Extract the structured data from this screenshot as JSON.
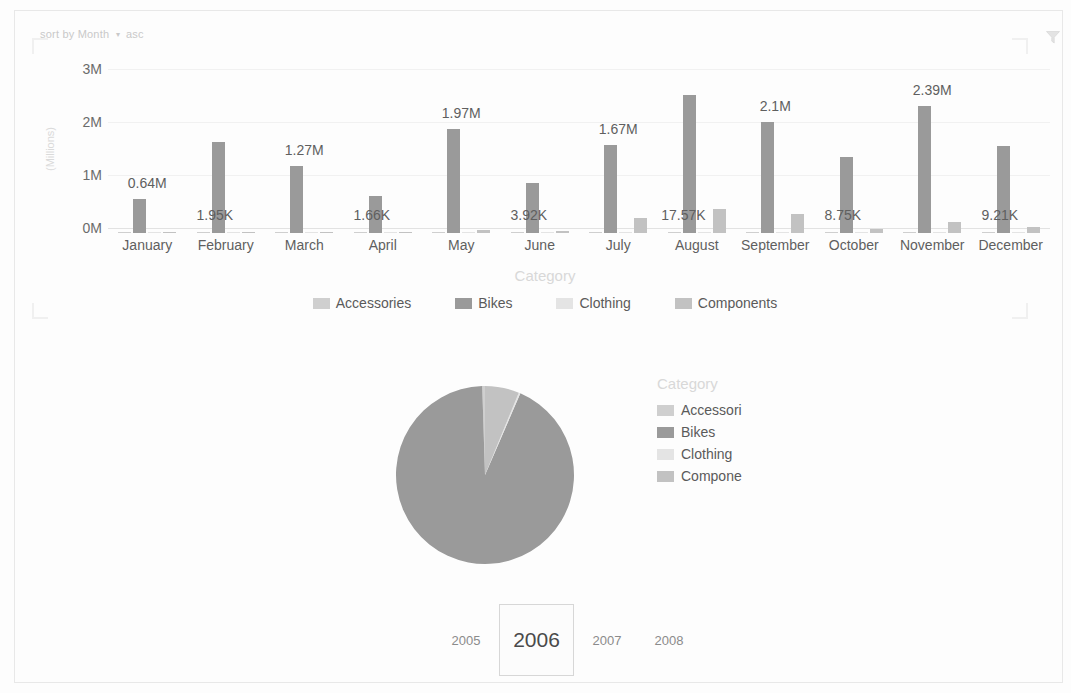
{
  "sort_control": {
    "prefix": "sort by",
    "field": "Month",
    "caret": "▾",
    "direction": "asc"
  },
  "filter": {
    "icon": "filter-funnel-icon"
  },
  "bar_legend": {
    "title": "Category",
    "items": [
      {
        "label": "Accessories",
        "color": "#cfcfcf"
      },
      {
        "label": "Bikes",
        "color": "#9a9a9a"
      },
      {
        "label": "Clothing",
        "color": "#e4e4e4"
      },
      {
        "label": "Components",
        "color": "#c2c2c2"
      }
    ]
  },
  "pie_legend": {
    "title": "Category",
    "items": [
      {
        "label": "Accessori",
        "color": "#cfcfcf"
      },
      {
        "label": "Bikes",
        "color": "#9a9a9a"
      },
      {
        "label": "Clothing",
        "color": "#e4e4e4"
      },
      {
        "label": "Compone",
        "color": "#c2c2c2"
      }
    ]
  },
  "year_slicer": {
    "years": [
      {
        "label": "2005",
        "selected": false
      },
      {
        "label": "2006",
        "selected": true
      },
      {
        "label": "2007",
        "selected": false
      },
      {
        "label": "2008",
        "selected": false
      }
    ]
  },
  "chart_data": [
    {
      "type": "bar",
      "title": "",
      "xlabel": "",
      "ylabel": "(Millions)",
      "ylim": [
        0,
        3000000
      ],
      "yticks": [
        "0M",
        "1M",
        "2M",
        "3M"
      ],
      "ytick_values": [
        0,
        1000000,
        2000000,
        3000000
      ],
      "grid": true,
      "legend_position": "bottom",
      "legend_title": "Category",
      "categories": [
        "January",
        "February",
        "March",
        "April",
        "May",
        "June",
        "July",
        "August",
        "September",
        "October",
        "November",
        "December"
      ],
      "series": [
        {
          "name": "Accessories",
          "color": "#cfcfcf",
          "values": [
            1200,
            1950,
            1400,
            1660,
            2800,
            3920,
            9500,
            17570,
            12000,
            8750,
            14500,
            9210
          ]
        },
        {
          "name": "Bikes",
          "color": "#9a9a9a",
          "values": [
            640000,
            1720000,
            1270000,
            700000,
            1970000,
            940000,
            1670000,
            2600000,
            2100000,
            1440000,
            2390000,
            1650000
          ]
        },
        {
          "name": "Clothing",
          "color": "#e4e4e4",
          "values": [
            900,
            5000,
            1100,
            1300,
            2100,
            3000,
            7000,
            11000,
            9000,
            6500,
            10500,
            7000
          ]
        },
        {
          "name": "Components",
          "color": "#c2c2c2",
          "values": [
            0,
            20000,
            0,
            0,
            52000,
            40000,
            290000,
            460000,
            360000,
            70000,
            210000,
            120000
          ]
        }
      ],
      "data_labels": [
        {
          "category": "January",
          "text": "0.64M"
        },
        {
          "category": "February",
          "text": "1.95K"
        },
        {
          "category": "March",
          "text": "1.27M"
        },
        {
          "category": "April",
          "text": "1.66K"
        },
        {
          "category": "May",
          "text": "1.97M"
        },
        {
          "category": "June",
          "text": "3.92K"
        },
        {
          "category": "July",
          "text": "1.67M"
        },
        {
          "category": "August",
          "text": "17.57K"
        },
        {
          "category": "September",
          "text": "2.1M"
        },
        {
          "category": "October",
          "text": "8.75K"
        },
        {
          "category": "November",
          "text": "2.39M"
        },
        {
          "category": "December",
          "text": "9.21K"
        }
      ]
    },
    {
      "type": "pie",
      "title": "",
      "legend_title": "Category",
      "legend_position": "right",
      "labels": [
        "Accessories",
        "Bikes",
        "Clothing",
        "Components"
      ],
      "values": [
        0.5,
        93.0,
        0.3,
        6.2
      ],
      "colors": [
        "#cfcfcf",
        "#9a9a9a",
        "#e4e4e4",
        "#c2c2c2"
      ]
    }
  ]
}
